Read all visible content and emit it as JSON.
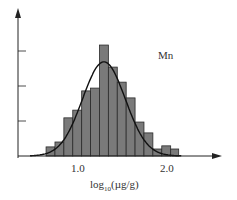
{
  "chart_data": {
    "type": "bar",
    "title": "",
    "annotation": "Mn",
    "xlabel": "log10(µg/g)",
    "xlabel_parts": {
      "base": "log",
      "sub": "10",
      "rest": "(µg/g)"
    },
    "ylabel": "",
    "x_tick_labels": [
      "1.0",
      "2.0"
    ],
    "x_ticks": [
      1.0,
      2.0
    ],
    "y_ticks": [
      1,
      2,
      3
    ],
    "grid": false,
    "bar_color": "#7a7a7a",
    "curve_color": "#111111",
    "bin_edges": [
      0.63,
      0.73,
      0.83,
      0.93,
      1.03,
      1.13,
      1.23,
      1.33,
      1.43,
      1.53,
      1.63,
      1.73,
      1.83,
      1.93,
      2.03,
      2.12
    ],
    "values": [
      0.26,
      0.4,
      1.09,
      1.31,
      1.86,
      1.94,
      3.17,
      2.54,
      2.11,
      1.66,
      0.97,
      0.66,
      0.2,
      0.29,
      0.2
    ],
    "fit_curve": {
      "type": "normal",
      "mean": 1.28,
      "sd": 0.24,
      "peak": 2.69
    },
    "xlim": [
      0.0,
      2.7
    ],
    "ylim": [
      0,
      3.6
    ]
  }
}
